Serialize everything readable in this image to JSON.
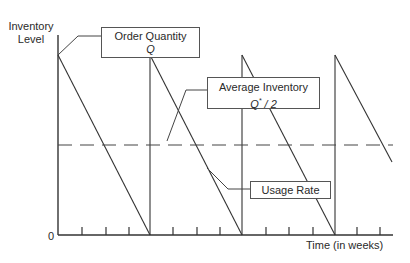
{
  "diagram": {
    "y_axis_label_line1": "Inventory",
    "y_axis_label_line2": "Level",
    "x_axis_label": "Time (in weeks)",
    "origin_label": "0",
    "callouts": {
      "order_quantity": {
        "line1": "Order Quantity",
        "line2": "Q"
      },
      "average_inventory": {
        "line1": "Average Inventory",
        "line2_var": "Q",
        "line2_sup": "*",
        "line2_rest": " / 2"
      },
      "usage_rate": {
        "line1": "Usage Rate"
      }
    },
    "colors": {
      "line": "#333333",
      "dashed": "#444444",
      "box_border": "#555555"
    }
  }
}
